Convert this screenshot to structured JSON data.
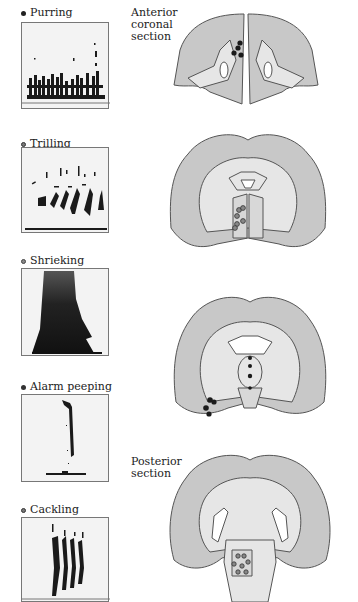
{
  "figure": {
    "section_labels": {
      "anterior": [
        "Anterior",
        "coronal",
        "section"
      ],
      "posterior": [
        "Posterior",
        "section"
      ]
    },
    "calls": [
      {
        "label": "Purring",
        "marker_color": "#222222"
      },
      {
        "label": "Trilling",
        "marker_color": "#777777"
      },
      {
        "label": "Shrieking",
        "marker_color": "#888888"
      },
      {
        "label": "Alarm peeping",
        "marker_color": "#333333"
      },
      {
        "label": "Cackling",
        "marker_color": "#777777"
      }
    ],
    "colors": {
      "gray_matter": "#c8c8c8",
      "white_matter": "#e6e6e6",
      "outline": "#555555",
      "spectrogram_bg": "#f3f3f3",
      "spectrogram_ink": "#1a1a1a"
    }
  }
}
